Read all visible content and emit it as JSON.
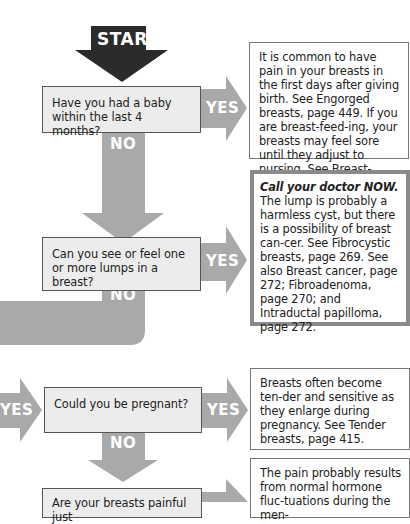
{
  "colors": {
    "start_arrow": "#2b2b2b",
    "flow_arrow": "#a9a9a9",
    "question_fill": "#ececec",
    "urgent_border": "#8a8a8a"
  },
  "start": {
    "label": "START"
  },
  "questions": [
    {
      "text": "Have you had a baby within the last 4 months?",
      "yes_label": "YES",
      "no_label": "NO"
    },
    {
      "text": "Can you see or feel one or more lumps in a breast?",
      "yes_label": "YES",
      "no_label": "NO"
    },
    {
      "text": "Could you be pregnant?",
      "incoming_label": "YES",
      "yes_label": "YES",
      "no_label": "NO"
    },
    {
      "text": "Are your breasts painful just"
    }
  ],
  "answers": [
    {
      "text": "It is common to have pain in your breasts in the first days after giving birth. See Engorged breasts, page 449. If you are breast-feed-ing, your breasts may feel sore until they adjust to nursing. See Breast-feeding, page 452."
    },
    {
      "emphasis": "Call your doctor NOW.",
      "text": "The lump is probably a harmless cyst, but there is a possibility of breast can-cer. See Fibrocystic breasts, page 269. See also Breast cancer, page 272; Fibroadenoma, page 270; and Intraductal papilloma, page 272."
    },
    {
      "text": "Breasts often become ten-der and sensitive as they enlarge during pregnancy. See Tender breasts, page 415."
    },
    {
      "text": "The pain probably results from normal hormone fluc-tuations during the men-"
    }
  ]
}
